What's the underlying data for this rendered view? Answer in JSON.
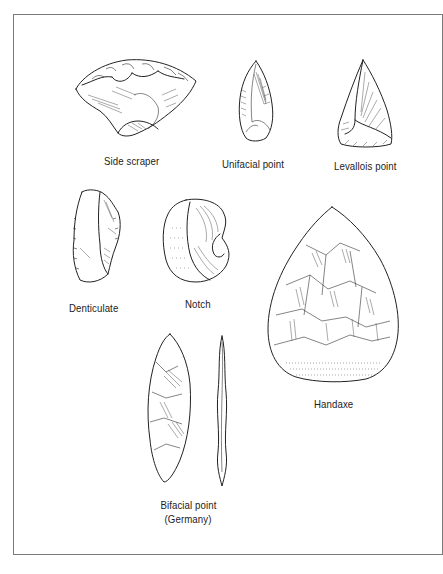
{
  "figure": {
    "artifacts": [
      {
        "id": "side-scraper",
        "label": "Side scraper"
      },
      {
        "id": "unifacial-point",
        "label": "Unifacial point"
      },
      {
        "id": "levallois-point",
        "label": "Levallois point"
      },
      {
        "id": "denticulate",
        "label": "Denticulate"
      },
      {
        "id": "notch",
        "label": "Notch"
      },
      {
        "id": "handaxe",
        "label": "Handaxe"
      },
      {
        "id": "bifacial-point",
        "label_line1": "Bifacial point",
        "label_line2": "(Germany)"
      }
    ],
    "colors": {
      "ink": "#222222",
      "frame": "#7a7a7a",
      "background": "#ffffff"
    }
  }
}
